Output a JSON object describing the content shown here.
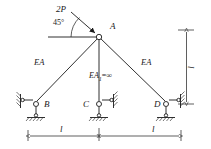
{
  "figure": {
    "type": "structural-truss-diagram",
    "stroke_color": "#1a1a1a",
    "background_color": "#ffffff"
  },
  "labels": {
    "load": "2P",
    "angle": "45°",
    "node_a": "A",
    "node_b": "B",
    "node_c": "C",
    "node_d": "D",
    "member_left": "EA",
    "member_right": "EA",
    "member_center_prefix": "EA",
    "member_center_sub": "1",
    "member_center_value": "=∞",
    "dim_bottom_left": "l",
    "dim_bottom_right": "l",
    "dim_right_vertical": "l"
  },
  "geometry": {
    "node_a": {
      "x": 99,
      "y": 37
    },
    "node_b": {
      "x": 36,
      "y": 104
    },
    "node_c": {
      "x": 99,
      "y": 104
    },
    "node_d": {
      "x": 166,
      "y": 104
    },
    "load_arrow_start": {
      "x": 71,
      "y": 12
    },
    "load_arrow_end": {
      "x": 97,
      "y": 35
    },
    "horizontal_ref_line": {
      "x1": 48,
      "y1": 37,
      "x2": 99,
      "y2": 37
    },
    "angle_arc_radius": 28,
    "dim_line_bottom_y": 136,
    "dim_line_right_x": 186,
    "dim_right_top_y": 30,
    "dim_right_bottom_y": 104
  },
  "members": [
    {
      "name": "A-B",
      "label": "EA",
      "from": "A",
      "to": "B"
    },
    {
      "name": "A-C",
      "label": "EA1=∞",
      "from": "A",
      "to": "C"
    },
    {
      "name": "A-D",
      "label": "EA",
      "from": "A",
      "to": "D"
    }
  ],
  "supports": [
    {
      "node": "B",
      "type": "pin-link-hatched",
      "wall_side": "left"
    },
    {
      "node": "C",
      "type": "pin-link-hatched",
      "wall_side": "right"
    },
    {
      "node": "D",
      "type": "pin-link-hatched",
      "wall_side": "right"
    }
  ]
}
